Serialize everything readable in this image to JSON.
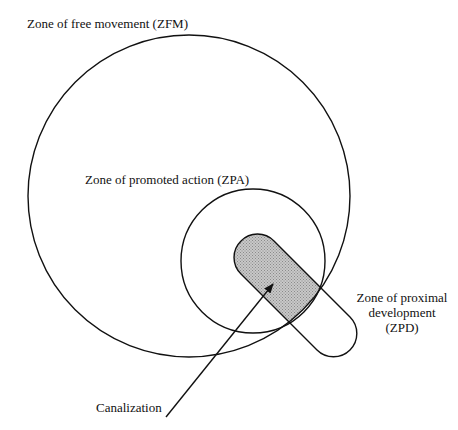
{
  "diagram": {
    "zones": [
      {
        "id": "zfm",
        "label": "Zone of free movement (ZFM)",
        "shape": "circle"
      },
      {
        "id": "zpa",
        "label": "Zone of promoted action (ZPA)",
        "shape": "circle"
      },
      {
        "id": "zpd",
        "label_lines": [
          "Zone of proximal",
          "development",
          "(ZPD)"
        ],
        "shape": "stadium",
        "fill": "#b8b8b8"
      }
    ],
    "arrow": {
      "label": "Canalization"
    },
    "colors": {
      "stroke": "#111111",
      "shaded": "#b8b8b8",
      "background": "#ffffff"
    }
  }
}
